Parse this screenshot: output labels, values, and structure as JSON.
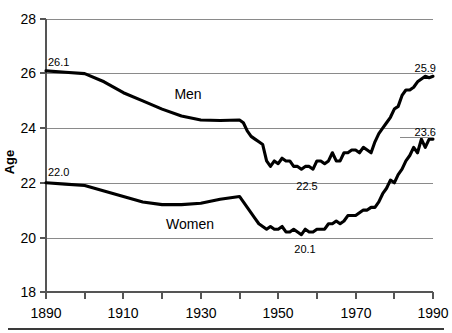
{
  "chart_data": {
    "type": "line",
    "title": "",
    "xlabel": "",
    "ylabel": "Age",
    "xlim": [
      1890,
      1990
    ],
    "ylim": [
      18,
      28
    ],
    "grid": true,
    "legend_position": "inline-labels",
    "x_ticks": [
      1890,
      1900,
      1910,
      1920,
      1930,
      1940,
      1950,
      1960,
      1970,
      1980,
      1990
    ],
    "x_tick_labels": [
      "1890",
      "",
      "1910",
      "",
      "1930",
      "",
      "1950",
      "",
      "1970",
      "",
      "1990"
    ],
    "y_ticks": [
      18,
      20,
      22,
      24,
      26,
      28
    ],
    "y_tick_labels": [
      "18",
      "20",
      "22",
      "24",
      "26",
      "28"
    ],
    "annotations": [
      {
        "text": "26.1",
        "x": 1890,
        "y": 26.1,
        "series": "Men",
        "note": "start value"
      },
      {
        "text": "25.9",
        "x": 1990,
        "y": 25.9,
        "series": "Men",
        "note": "end value"
      },
      {
        "text": "22.5",
        "x": 1956,
        "y": 22.5,
        "series": "Men",
        "note": "minimum"
      },
      {
        "text": "22.0",
        "x": 1890,
        "y": 22.0,
        "series": "Women",
        "note": "start value"
      },
      {
        "text": "23.6",
        "x": 1990,
        "y": 23.6,
        "series": "Women",
        "note": "end value"
      },
      {
        "text": "20.1",
        "x": 1956,
        "y": 20.1,
        "series": "Women",
        "note": "minimum"
      }
    ],
    "series": [
      {
        "name": "Men",
        "label": "Men",
        "color": "#000000",
        "x": [
          1890,
          1895,
          1900,
          1905,
          1910,
          1915,
          1920,
          1925,
          1930,
          1935,
          1940,
          1941,
          1942,
          1943,
          1944,
          1945,
          1946,
          1947,
          1948,
          1949,
          1950,
          1951,
          1952,
          1953,
          1954,
          1955,
          1956,
          1957,
          1958,
          1959,
          1960,
          1961,
          1962,
          1963,
          1964,
          1965,
          1966,
          1967,
          1968,
          1969,
          1970,
          1971,
          1972,
          1973,
          1974,
          1975,
          1976,
          1977,
          1978,
          1979,
          1980,
          1981,
          1982,
          1983,
          1984,
          1985,
          1986,
          1987,
          1988,
          1989,
          1990
        ],
        "values": [
          26.1,
          26.05,
          26.0,
          25.7,
          25.3,
          25.0,
          24.7,
          24.45,
          24.3,
          24.28,
          24.3,
          24.2,
          23.9,
          23.7,
          23.6,
          23.5,
          23.4,
          22.8,
          22.6,
          22.8,
          22.7,
          22.9,
          22.8,
          22.8,
          22.6,
          22.6,
          22.5,
          22.6,
          22.6,
          22.5,
          22.8,
          22.8,
          22.7,
          22.8,
          23.1,
          22.8,
          22.8,
          23.1,
          23.1,
          23.2,
          23.2,
          23.1,
          23.3,
          23.2,
          23.1,
          23.5,
          23.8,
          24.0,
          24.2,
          24.4,
          24.7,
          24.8,
          25.2,
          25.4,
          25.4,
          25.5,
          25.7,
          25.8,
          25.9,
          25.85,
          25.9
        ]
      },
      {
        "name": "Women",
        "label": "Women",
        "color": "#000000",
        "x": [
          1890,
          1895,
          1900,
          1905,
          1910,
          1915,
          1920,
          1925,
          1930,
          1935,
          1940,
          1941,
          1942,
          1943,
          1944,
          1945,
          1946,
          1947,
          1948,
          1949,
          1950,
          1951,
          1952,
          1953,
          1954,
          1955,
          1956,
          1957,
          1958,
          1959,
          1960,
          1961,
          1962,
          1963,
          1964,
          1965,
          1966,
          1967,
          1968,
          1969,
          1970,
          1971,
          1972,
          1973,
          1974,
          1975,
          1976,
          1977,
          1978,
          1979,
          1980,
          1981,
          1982,
          1983,
          1984,
          1985,
          1986,
          1987,
          1988,
          1989,
          1990
        ],
        "values": [
          22.0,
          21.95,
          21.9,
          21.7,
          21.5,
          21.3,
          21.2,
          21.2,
          21.25,
          21.4,
          21.5,
          21.3,
          21.1,
          20.9,
          20.7,
          20.5,
          20.4,
          20.3,
          20.4,
          20.3,
          20.3,
          20.4,
          20.2,
          20.2,
          20.3,
          20.2,
          20.1,
          20.3,
          20.2,
          20.2,
          20.3,
          20.3,
          20.3,
          20.5,
          20.5,
          20.6,
          20.5,
          20.6,
          20.8,
          20.8,
          20.8,
          20.9,
          21.0,
          21.0,
          21.1,
          21.1,
          21.3,
          21.6,
          21.8,
          22.1,
          22.0,
          22.3,
          22.5,
          22.8,
          23.0,
          23.3,
          23.1,
          23.6,
          23.3,
          23.6,
          23.6
        ]
      }
    ]
  },
  "axis": {
    "y_label": "Age",
    "y_tick_28": "28",
    "y_tick_26": "26",
    "y_tick_24": "24",
    "y_tick_22": "22",
    "y_tick_20": "20",
    "y_tick_18": "18",
    "x_tick_1890": "1890",
    "x_tick_1910": "1910",
    "x_tick_1930": "1930",
    "x_tick_1950": "1950",
    "x_tick_1970": "1970",
    "x_tick_1990": "1990"
  },
  "labels": {
    "men": "Men",
    "women": "Women",
    "men_start": "26.1",
    "men_end": "25.9",
    "men_min": "22.5",
    "women_start": "22.0",
    "women_end": "23.6",
    "women_min": "20.1"
  },
  "colors": {
    "line": "#000000",
    "grid": "#8a8a8a",
    "axis": "#555555",
    "background": "#ffffff"
  }
}
